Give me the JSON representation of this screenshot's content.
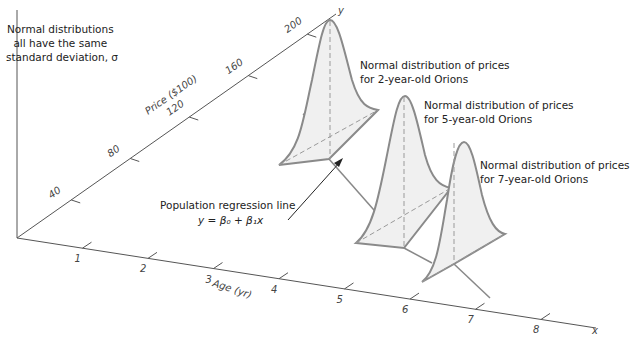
{
  "diagram": {
    "axes": {
      "x": {
        "label": "Age (yr)",
        "end_label": "x",
        "ticks": [
          "1",
          "2",
          "3",
          "4",
          "5",
          "6",
          "7",
          "8"
        ]
      },
      "y": {
        "label": "Price ($100)",
        "end_label": "y",
        "ticks": [
          "40",
          "80",
          "120",
          "160",
          "200"
        ]
      }
    },
    "annotations": {
      "sd_note": [
        "Normal distributions",
        "all have the same",
        "standard deviation, σ"
      ],
      "regression_label": "Population regression line",
      "regression_equation": "y = β₀ + β₁x",
      "dist_2yr": [
        "Normal distribution of prices",
        "for 2-year-old Orions"
      ],
      "dist_5yr": [
        "Normal distribution of prices",
        "for 5-year-old Orions"
      ],
      "dist_7yr": [
        "Normal distribution of prices",
        "for 7-year-old Orions"
      ]
    },
    "distributions": [
      {
        "age": 2,
        "label_key": "dist_2yr"
      },
      {
        "age": 5,
        "label_key": "dist_5yr"
      },
      {
        "age": 7,
        "label_key": "dist_7yr"
      }
    ],
    "colors": {
      "curve": "#8a8a8a",
      "fill": "#f0f0f0",
      "axis": "#555555",
      "text": "#222222"
    }
  }
}
